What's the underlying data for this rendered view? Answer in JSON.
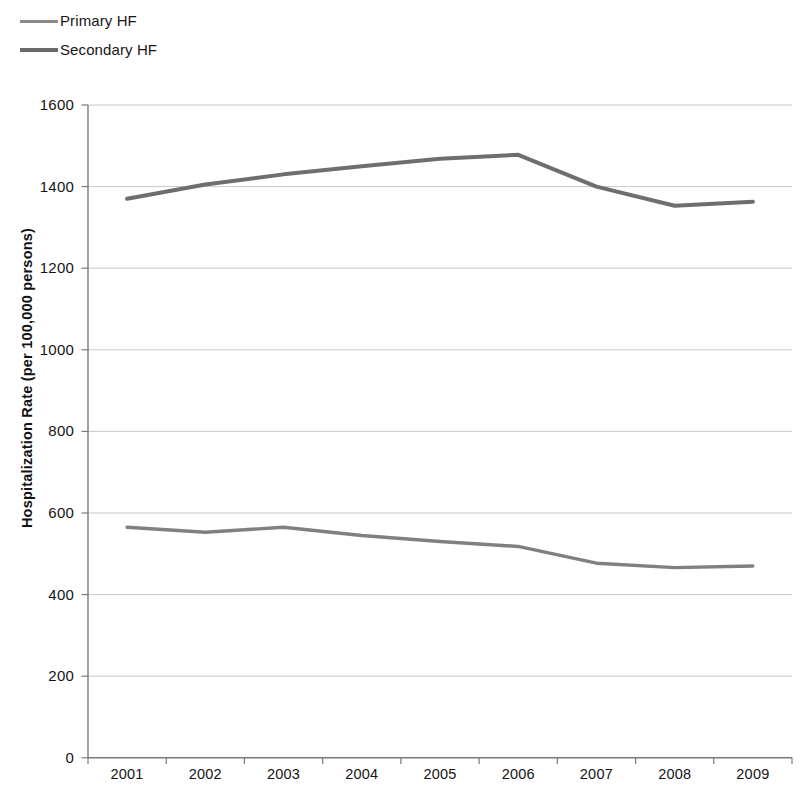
{
  "chart_data": {
    "type": "line",
    "title": "",
    "subtitle": "",
    "xlabel": "",
    "ylabel": "Hospitalization Rate (per 100,000 persons)",
    "categories": [
      "2001",
      "2002",
      "2003",
      "2004",
      "2005",
      "2006",
      "2007",
      "2008",
      "2009"
    ],
    "x": [
      2001,
      2002,
      2003,
      2004,
      2005,
      2006,
      2007,
      2008,
      2009
    ],
    "series": [
      {
        "name": "Primary HF",
        "color": "#808080",
        "values": [
          565,
          553,
          565,
          545,
          530,
          518,
          477,
          466,
          470
        ]
      },
      {
        "name": "Secondary HF",
        "color": "#6e6e6e",
        "values": [
          1370,
          1405,
          1430,
          1450,
          1468,
          1478,
          1400,
          1353,
          1363
        ]
      }
    ],
    "ylim": [
      0,
      1600
    ],
    "yticks": [
      0,
      200,
      400,
      600,
      800,
      1000,
      1200,
      1400,
      1600
    ],
    "ytick_labels": [
      "0",
      "200",
      "400",
      "600",
      "800",
      "1000",
      "1200",
      "1400",
      "1600"
    ],
    "grid": "horizontal",
    "legend_position": "top-left",
    "legend_entries": [
      "Primary HF",
      "Secondary HF"
    ]
  },
  "legend": {
    "entries": [
      {
        "label": "Primary HF",
        "color": "#8a8a8a"
      },
      {
        "label": "Secondary HF",
        "color": "#6a6a6a"
      }
    ]
  },
  "axes": {
    "y_title": "Hospitalization Rate (per 100,000 persons)",
    "x_title": ""
  },
  "colors": {
    "gridline": "#c9c9c9",
    "axis": "#7a7a7a",
    "primary_hf": "#8a8a8a",
    "secondary_hf": "#6a6a6a",
    "background": "#ffffff",
    "text": "#141414"
  }
}
